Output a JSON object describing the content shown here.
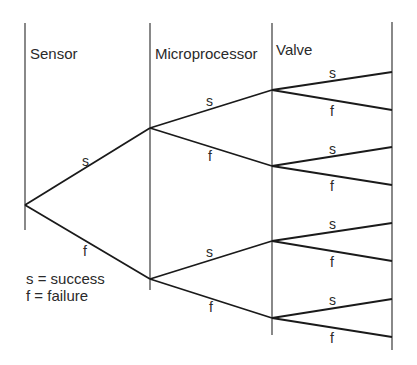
{
  "diagram": {
    "type": "event-tree",
    "columns": [
      {
        "label": "Sensor",
        "x": 25,
        "y1": 23,
        "y2": 230
      },
      {
        "label": "Microprocessor",
        "x": 150,
        "y1": 23,
        "y2": 290
      },
      {
        "label": "Valve",
        "x": 272,
        "y1": 23,
        "y2": 335
      },
      {
        "label": "",
        "x": 392,
        "y1": 22,
        "y2": 350
      }
    ],
    "legend": {
      "line1": "s = success",
      "line2": "f = failure"
    },
    "branch_labels": {
      "success": "s",
      "failure": "f"
    },
    "colors": {
      "line": "#1a1a1a",
      "text": "#2a2a2a",
      "background": "#ffffff"
    }
  }
}
